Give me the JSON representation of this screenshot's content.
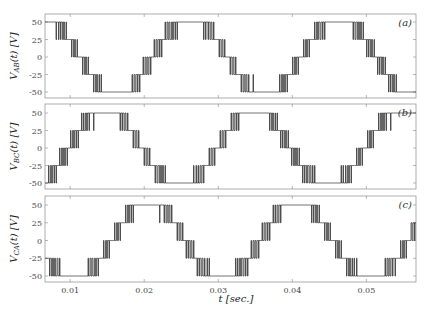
{
  "chart_data": [
    {
      "type": "line",
      "title": "",
      "panel_label": "(a)",
      "ylabel": "V_AB(t) [V]",
      "ylabel_main": "V",
      "ylabel_sub": "AB",
      "ylabel_rest": "(t) [V]",
      "xlabel": "t [sec.]",
      "xlim": [
        0.0066,
        0.0567
      ],
      "ylim": [
        -60,
        55
      ],
      "yticks": [
        50,
        25,
        0,
        -25,
        -50
      ],
      "xticks": [
        0.01,
        0.02,
        0.03,
        0.04,
        0.05
      ],
      "waveform": "5-level PWM staircase",
      "amplitude": 50,
      "levels": [
        -50,
        -25,
        0,
        25,
        50
      ],
      "frequency_hz": 50,
      "peak_time": 0.0262
    },
    {
      "type": "line",
      "title": "",
      "panel_label": "(b)",
      "ylabel": "V_BC(t) [V]",
      "ylabel_main": "V",
      "ylabel_sub": "BC",
      "ylabel_rest": "(t) [V]",
      "xlabel": "t [sec.]",
      "xlim": [
        0.0066,
        0.0567
      ],
      "ylim": [
        -60,
        55
      ],
      "yticks": [
        50,
        25,
        0,
        -25,
        -50
      ],
      "xticks": [
        0.01,
        0.02,
        0.03,
        0.04,
        0.05
      ],
      "waveform": "5-level PWM staircase",
      "amplitude": 50,
      "levels": [
        -50,
        -25,
        0,
        25,
        50
      ],
      "frequency_hz": 50,
      "peak_time": 0.0148
    },
    {
      "type": "line",
      "title": "",
      "panel_label": "(c)",
      "ylabel": "V_CA(t) [V]",
      "ylabel_main": "V",
      "ylabel_sub": "CA",
      "ylabel_rest": "(t) [V]",
      "xlabel": "t [sec.]",
      "xlim": [
        0.0066,
        0.0567
      ],
      "ylim": [
        -60,
        55
      ],
      "yticks": [
        50,
        25,
        0,
        -25,
        -50
      ],
      "xticks": [
        0.01,
        0.02,
        0.03,
        0.04,
        0.05
      ],
      "xtick_labels": [
        "0.01",
        "0.02",
        "0.03",
        "0.04",
        "0.05"
      ],
      "waveform": "5-level PWM staircase",
      "amplitude": 50,
      "levels": [
        -50,
        -25,
        0,
        25,
        50
      ],
      "frequency_hz": 50,
      "peak_time": 0.0205
    }
  ],
  "layout": {
    "x_left": 45,
    "x_right": 416,
    "panels": [
      {
        "top": 14,
        "bottom": 98,
        "y50": 22,
        "ym50": 92
      },
      {
        "top": 104,
        "bottom": 189,
        "y50": 113,
        "ym50": 183
      },
      {
        "top": 196,
        "bottom": 282,
        "y50": 205,
        "ym50": 276
      }
    ],
    "frame_color": "#999999",
    "trace_color": "#222222"
  }
}
